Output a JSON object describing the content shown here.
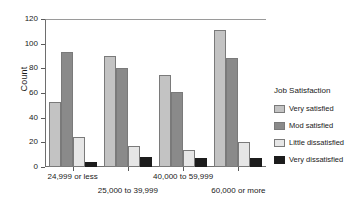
{
  "chart_data": {
    "type": "bar",
    "title": "",
    "xlabel": "",
    "ylabel": "Count",
    "ylim": [
      0,
      120
    ],
    "yticks": [
      0,
      20,
      40,
      60,
      80,
      100,
      120
    ],
    "grid": false,
    "legend_position": "right",
    "legend_title": "Job Satisfaction",
    "categories": [
      "24,999 or less",
      "25,000 to 39,999",
      "40,000 to 59,999",
      "60,000 or more"
    ],
    "series": [
      {
        "name": "Very satisfied",
        "color": "#c3c3c3",
        "values": [
          53,
          90,
          75,
          111
        ]
      },
      {
        "name": "Mod satisfied",
        "color": "#8a8a8a",
        "values": [
          93,
          80,
          61,
          88
        ]
      },
      {
        "name": "Little dissatisfied",
        "color": "#e6e6e6",
        "values": [
          24,
          17,
          14,
          20
        ]
      },
      {
        "name": "Very dissatisfied",
        "color": "#1c1c1c",
        "values": [
          4,
          8,
          7,
          7
        ]
      }
    ]
  }
}
